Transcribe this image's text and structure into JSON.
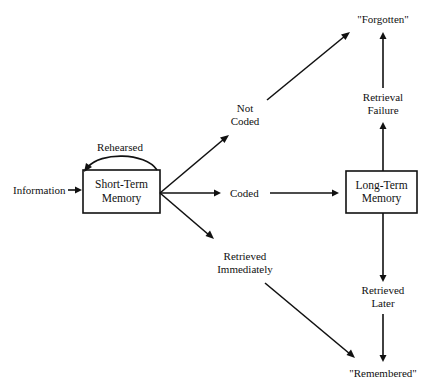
{
  "diagram": {
    "type": "flowchart",
    "topic": "memory model",
    "nodes": {
      "information": {
        "label": "Information"
      },
      "short_term_memory": {
        "line1": "Short-Term",
        "line2": "Memory"
      },
      "rehearsed": {
        "label": "Rehearsed"
      },
      "not_coded": {
        "line1": "Not",
        "line2": "Coded"
      },
      "coded": {
        "label": "Coded"
      },
      "retrieved_immediately": {
        "line1": "Retrieved",
        "line2": "Immediately"
      },
      "long_term_memory": {
        "line1": "Long-Term",
        "line2": "Memory"
      },
      "retrieval_failure": {
        "line1": "Retrieval",
        "line2": "Failure"
      },
      "retrieved_later": {
        "line1": "Retrieved",
        "line2": "Later"
      },
      "forgotten": {
        "label": "\"Forgotten\""
      },
      "remembered": {
        "label": "\"Remembered\""
      }
    },
    "edges": [
      {
        "from": "Information",
        "to": "Short-Term Memory"
      },
      {
        "from": "Short-Term Memory",
        "to": "Short-Term Memory",
        "label": "Rehearsed"
      },
      {
        "from": "Short-Term Memory",
        "to": "Not Coded"
      },
      {
        "from": "Short-Term Memory",
        "to": "Coded"
      },
      {
        "from": "Short-Term Memory",
        "to": "Retrieved Immediately"
      },
      {
        "from": "Not Coded",
        "to": "\"Forgotten\""
      },
      {
        "from": "Coded",
        "to": "Long-Term Memory"
      },
      {
        "from": "Retrieved Immediately",
        "to": "\"Remembered\""
      },
      {
        "from": "Long-Term Memory",
        "to": "Retrieval Failure"
      },
      {
        "from": "Retrieval Failure",
        "to": "\"Forgotten\""
      },
      {
        "from": "Long-Term Memory",
        "to": "Retrieved Later"
      },
      {
        "from": "Retrieved Later",
        "to": "\"Remembered\""
      }
    ],
    "colors": {
      "ink": "#111111",
      "background": "#ffffff"
    }
  }
}
